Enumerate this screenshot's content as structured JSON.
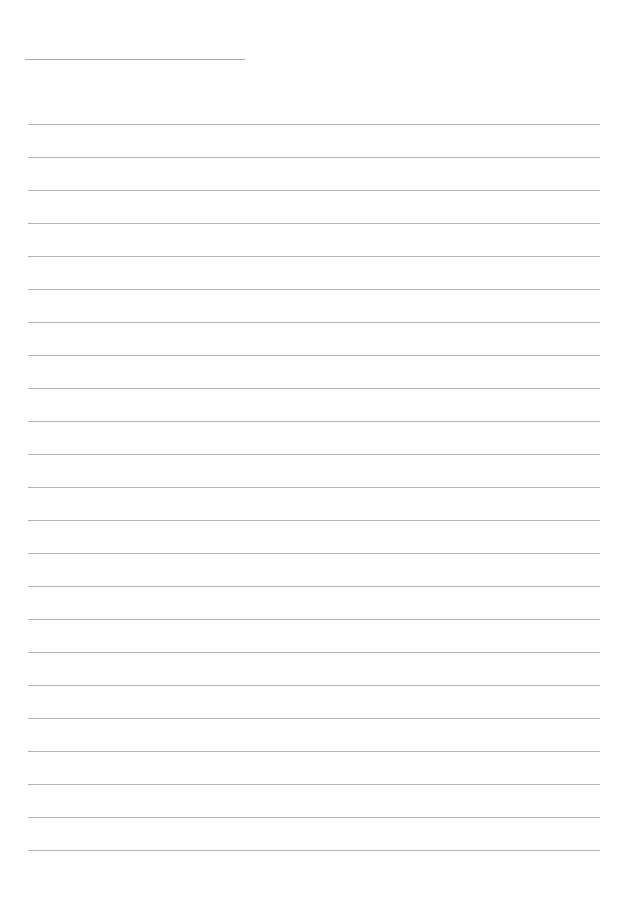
{
  "page": {
    "type": "lined-paper",
    "background_color": "#ffffff",
    "line_color": "#b4b4b4",
    "title_line": {
      "x": 25,
      "y": 59,
      "width": 220,
      "color": "#a8a8a8"
    },
    "ruled_lines": {
      "count": 23,
      "x": 28,
      "width": 572,
      "first_y": 124,
      "spacing": 33
    }
  }
}
